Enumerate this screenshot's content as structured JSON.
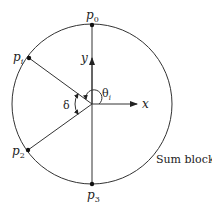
{
  "diagram": {
    "block_label": "Sum block",
    "points": {
      "p0": {
        "name": "p",
        "sub": "0"
      },
      "pi": {
        "name": "p",
        "sub": "i"
      },
      "p2": {
        "name": "p",
        "sub": "2"
      },
      "p3": {
        "name": "p",
        "sub": "3"
      }
    },
    "axes": {
      "x": "x",
      "y": "y"
    },
    "angles": {
      "theta": {
        "name": "θ",
        "sub": "i"
      },
      "delta": "δ"
    },
    "colors": {
      "stroke": "#222222",
      "background": "#ffffff"
    }
  }
}
